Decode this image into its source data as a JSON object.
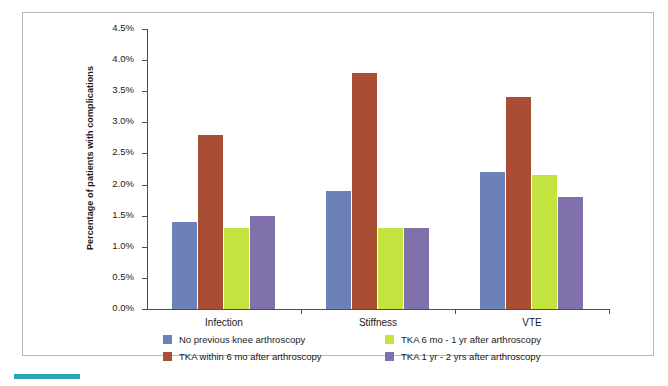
{
  "chart_data": {
    "type": "bar",
    "title": "",
    "xlabel": "",
    "ylabel": "Percentage of patients with complications",
    "categories": [
      "Infection",
      "Stiffness",
      "VTE"
    ],
    "ylim": [
      0,
      4.5
    ],
    "ytick_values": [
      0.0,
      0.5,
      1.0,
      1.5,
      2.0,
      2.5,
      3.0,
      3.5,
      4.0,
      4.5
    ],
    "ytick_labels": [
      "0.0%",
      "0.5%",
      "1.0%",
      "1.5%",
      "2.0%",
      "2.5%",
      "3.0%",
      "3.5%",
      "4.0%",
      "4.5%"
    ],
    "grid": false,
    "legend_position": "bottom",
    "series": [
      {
        "name": "No previous knee arthroscopy",
        "color": "#6b81b8",
        "values": [
          1.4,
          1.9,
          2.2
        ]
      },
      {
        "name": "TKA within 6 mo after arthroscopy",
        "color": "#a94e34",
        "values": [
          2.8,
          3.8,
          3.4
        ]
      },
      {
        "name": "TKA 6 mo - 1 yr after arthroscopy",
        "color": "#c3e33e",
        "values": [
          1.3,
          1.3,
          2.15
        ]
      },
      {
        "name": "TKA 1 yr - 2 yrs after arthroscopy",
        "color": "#8071ad",
        "values": [
          1.5,
          1.3,
          1.8
        ]
      }
    ]
  },
  "colors": {
    "series_1": "#6b81b8",
    "series_2": "#a94e34",
    "series_3": "#c3e33e",
    "series_4": "#8071ad",
    "accent": "#2ba3b5",
    "axis": "#4d4d4d",
    "frame": "#b9b9b9"
  }
}
